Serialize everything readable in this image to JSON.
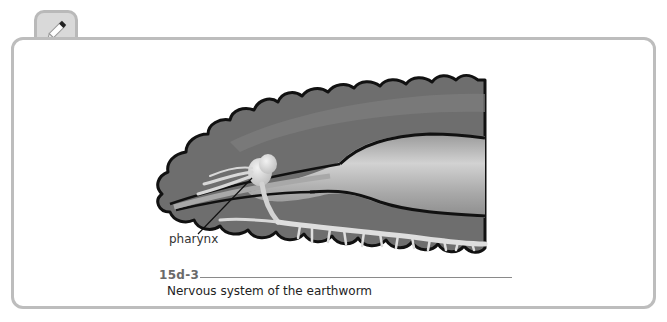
{
  "figure": {
    "number": "15d-3",
    "caption": "Nervous system of the earthworm",
    "labels": [
      {
        "text": "pharynx"
      }
    ]
  },
  "icons": {
    "note_tab": "pencil-icon"
  },
  "colors": {
    "frame_border": "#bdbdbd",
    "tab_fill": "#d9d9d9",
    "body_dark": "#6e6e6e",
    "gut_light": "#bdbdbd",
    "nerve": "#dcdcdc",
    "outline": "#111111"
  }
}
